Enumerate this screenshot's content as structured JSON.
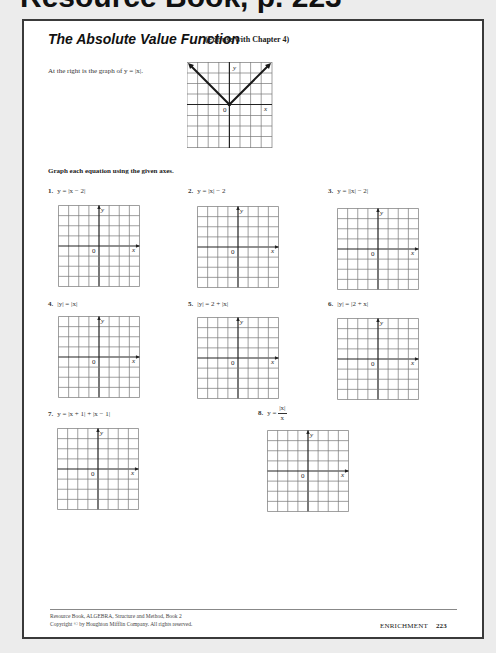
{
  "header": {
    "top_text": "Resource Book, p. 223"
  },
  "worksheet": {
    "title": "The Absolute Value Function",
    "subtitle": "(For use with Chapter 4)",
    "intro": "At the right is the graph of y = |x|.",
    "instructions": "Graph each equation using the given axes.",
    "example_graph": {
      "function": "y = |x|",
      "axis_x_label": "x",
      "axis_y_label": "y",
      "origin_label": "0",
      "grid_size": 8
    },
    "problems": [
      {
        "number": "1.",
        "equation": "y = |x − 2|"
      },
      {
        "number": "2.",
        "equation": "y = |x| − 2"
      },
      {
        "number": "3.",
        "equation": "y = ||x| − 2|"
      },
      {
        "number": "4.",
        "equation": "|y| = |x|"
      },
      {
        "number": "5.",
        "equation": "|y| = 2 + |x|"
      },
      {
        "number": "6.",
        "equation": "|y| = |2 + x|"
      },
      {
        "number": "7.",
        "equation": "y = |x + 1| + |x − 1|"
      },
      {
        "number": "8.",
        "equation_prefix": "y =",
        "numerator": "|x|",
        "denominator": "x"
      }
    ],
    "axis_labels": {
      "x": "x",
      "y": "y",
      "origin": "0"
    }
  },
  "footer": {
    "line1": "Resource Book, ALGEBRA, Structure and Method, Book 2",
    "line2": "Copyright © by Houghton Mifflin Company. All rights reserved.",
    "section": "ENRICHMENT",
    "page_number": "223"
  }
}
